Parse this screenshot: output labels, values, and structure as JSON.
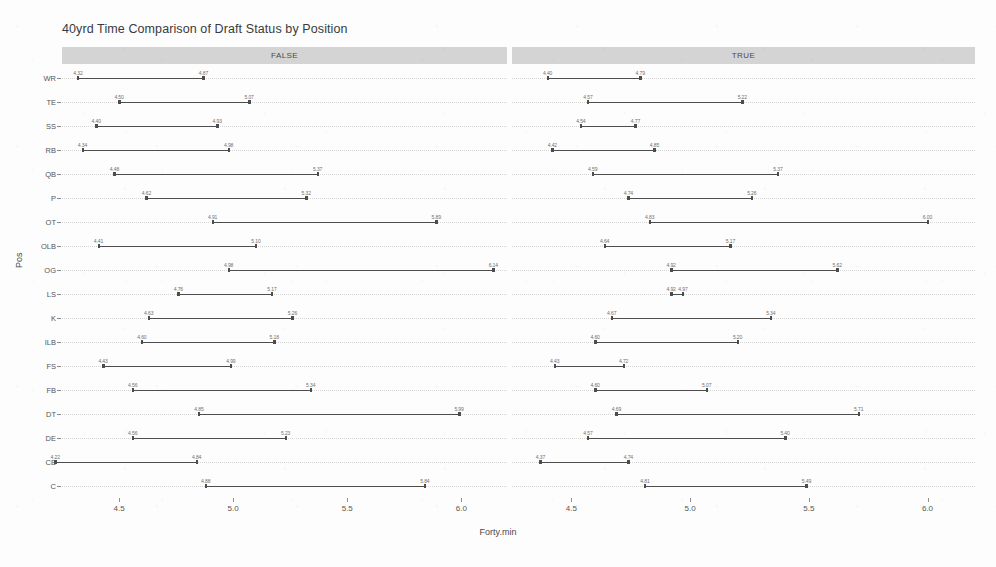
{
  "chart_data": {
    "type": "bar",
    "title": "40yrd Time Comparison of Draft Status by Position",
    "xlabel": "Forty.min",
    "ylabel": "Pos",
    "xlim": [
      4.25,
      6.2
    ],
    "grid": true,
    "legend": "none",
    "facet_variable": "Draft Status",
    "facets": [
      "FALSE",
      "TRUE"
    ],
    "xticks": [
      "4.5",
      "5.0",
      "5.5",
      "6.0"
    ],
    "xtick_values": [
      4.5,
      5.0,
      5.5,
      6.0
    ],
    "categories": [
      "WR",
      "TE",
      "SS",
      "RB",
      "QB",
      "P",
      "OT",
      "OLB",
      "OG",
      "LS",
      "K",
      "ILB",
      "FS",
      "FB",
      "DT",
      "DE",
      "CB",
      "C"
    ],
    "series": [
      {
        "name": "FALSE",
        "rows": [
          {
            "pos": "WR",
            "low": 4.32,
            "high": 4.87,
            "low_label": "4.32",
            "high_label": "4.87"
          },
          {
            "pos": "TE",
            "low": 4.5,
            "high": 5.07,
            "low_label": "4.50",
            "high_label": "5.07"
          },
          {
            "pos": "SS",
            "low": 4.4,
            "high": 4.93,
            "low_label": "4.40",
            "high_label": "4.93"
          },
          {
            "pos": "RB",
            "low": 4.34,
            "high": 4.98,
            "low_label": "4.34",
            "high_label": "4.98"
          },
          {
            "pos": "QB",
            "low": 4.48,
            "high": 5.37,
            "low_label": "4.48",
            "high_label": "5.37"
          },
          {
            "pos": "P",
            "low": 4.62,
            "high": 5.32,
            "low_label": "4.62",
            "high_label": "5.32"
          },
          {
            "pos": "OT",
            "low": 4.91,
            "high": 5.89,
            "low_label": "4.91",
            "high_label": "5.89"
          },
          {
            "pos": "OLB",
            "low": 4.41,
            "high": 5.1,
            "low_label": "4.41",
            "high_label": "5.10"
          },
          {
            "pos": "OG",
            "low": 4.98,
            "high": 6.14,
            "low_label": "4.98",
            "high_label": "6.14"
          },
          {
            "pos": "LS",
            "low": 4.76,
            "high": 5.17,
            "low_label": "4.76",
            "high_label": "5.17"
          },
          {
            "pos": "K",
            "low": 4.63,
            "high": 5.26,
            "low_label": "4.63",
            "high_label": "5.26"
          },
          {
            "pos": "ILB",
            "low": 4.6,
            "high": 5.18,
            "low_label": "4.60",
            "high_label": "5.18"
          },
          {
            "pos": "FS",
            "low": 4.43,
            "high": 4.99,
            "low_label": "4.43",
            "high_label": "4.99"
          },
          {
            "pos": "FB",
            "low": 4.56,
            "high": 5.34,
            "low_label": "4.56",
            "high_label": "5.34"
          },
          {
            "pos": "DT",
            "low": 4.85,
            "high": 5.99,
            "low_label": "4.85",
            "high_label": "5.99"
          },
          {
            "pos": "DE",
            "low": 4.56,
            "high": 5.23,
            "low_label": "4.56",
            "high_label": "5.23"
          },
          {
            "pos": "CB",
            "low": 4.22,
            "high": 4.84,
            "low_label": "4.22",
            "high_label": "4.84"
          },
          {
            "pos": "C",
            "low": 4.88,
            "high": 5.84,
            "low_label": "4.88",
            "high_label": "5.84"
          }
        ]
      },
      {
        "name": "TRUE",
        "rows": [
          {
            "pos": "WR",
            "low": 4.4,
            "high": 4.79,
            "low_label": "4.40",
            "high_label": "4.79"
          },
          {
            "pos": "TE",
            "low": 4.57,
            "high": 5.22,
            "low_label": "4.57",
            "high_label": "5.22"
          },
          {
            "pos": "SS",
            "low": 4.54,
            "high": 4.77,
            "low_label": "4.54",
            "high_label": "4.77"
          },
          {
            "pos": "RB",
            "low": 4.42,
            "high": 4.85,
            "low_label": "4.42",
            "high_label": "4.85"
          },
          {
            "pos": "QB",
            "low": 4.59,
            "high": 5.37,
            "low_label": "4.59",
            "high_label": "5.37"
          },
          {
            "pos": "P",
            "low": 4.74,
            "high": 5.26,
            "low_label": "4.74",
            "high_label": "5.26"
          },
          {
            "pos": "OT",
            "low": 4.83,
            "high": 6.0,
            "low_label": "4.83",
            "high_label": "6.00"
          },
          {
            "pos": "OLB",
            "low": 4.64,
            "high": 5.17,
            "low_label": "4.64",
            "high_label": "5.17"
          },
          {
            "pos": "OG",
            "low": 4.92,
            "high": 5.62,
            "low_label": "4.92",
            "high_label": "5.62"
          },
          {
            "pos": "LS",
            "low": 4.92,
            "high": 4.97,
            "low_label": "4.92",
            "high_label": "4.97"
          },
          {
            "pos": "K",
            "low": 4.67,
            "high": 5.34,
            "low_label": "4.67",
            "high_label": "5.34"
          },
          {
            "pos": "ILB",
            "low": 4.6,
            "high": 5.2,
            "low_label": "4.60",
            "high_label": "5.20"
          },
          {
            "pos": "FS",
            "low": 4.43,
            "high": 4.72,
            "low_label": "4.43",
            "high_label": "4.72"
          },
          {
            "pos": "FB",
            "low": 4.6,
            "high": 5.07,
            "low_label": "4.60",
            "high_label": "5.07"
          },
          {
            "pos": "DT",
            "low": 4.69,
            "high": 5.71,
            "low_label": "4.69",
            "high_label": "5.71"
          },
          {
            "pos": "DE",
            "low": 4.57,
            "high": 5.4,
            "low_label": "4.57",
            "high_label": "5.40"
          },
          {
            "pos": "CB",
            "low": 4.37,
            "high": 4.74,
            "low_label": "4.37",
            "high_label": "4.74"
          },
          {
            "pos": "C",
            "low": 4.81,
            "high": 5.49,
            "low_label": "4.81",
            "high_label": "5.49"
          }
        ]
      }
    ],
    "colors": {
      "segment": "#4d4d4d",
      "strip_background": "#d4d4d4",
      "gridline": "#c9c9c9",
      "text": "#4a4a4a",
      "page_background": "#fdfdfd"
    }
  }
}
